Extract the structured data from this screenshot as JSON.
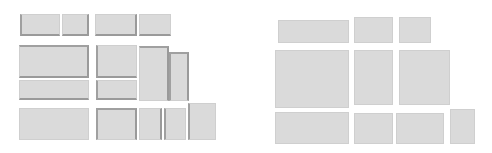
{
  "diagram": {
    "colors": {
      "tile_fill": "#dadada",
      "tile_edge": "#9a9a9a",
      "background": "#ffffff"
    },
    "panels": [
      {
        "name": "left",
        "tiles": [
          {
            "x": 20,
            "y": 14,
            "w": 40,
            "h": 22,
            "edges": "l b"
          },
          {
            "x": 62,
            "y": 14,
            "w": 27,
            "h": 22,
            "edges": "b r"
          },
          {
            "x": 95,
            "y": 14,
            "w": 42,
            "h": 22,
            "edges": "b r"
          },
          {
            "x": 139,
            "y": 14,
            "w": 32,
            "h": 22,
            "edges": "b"
          },
          {
            "x": 19,
            "y": 45,
            "w": 70,
            "h": 33,
            "edges": "t r b"
          },
          {
            "x": 96,
            "y": 45,
            "w": 41,
            "h": 33,
            "edges": "l b"
          },
          {
            "x": 139,
            "y": 46,
            "w": 30,
            "h": 55,
            "edges": "t r"
          },
          {
            "x": 169,
            "y": 52,
            "w": 20,
            "h": 49,
            "edges": "t r l"
          },
          {
            "x": 19,
            "y": 80,
            "w": 70,
            "h": 20,
            "edges": "b"
          },
          {
            "x": 96,
            "y": 80,
            "w": 41,
            "h": 20,
            "edges": "l b"
          },
          {
            "x": 19,
            "y": 108,
            "w": 70,
            "h": 32,
            "edges": ""
          },
          {
            "x": 96,
            "y": 108,
            "w": 41,
            "h": 32,
            "edges": "l t r"
          },
          {
            "x": 139,
            "y": 108,
            "w": 23,
            "h": 32,
            "edges": "r"
          },
          {
            "x": 164,
            "y": 108,
            "w": 22,
            "h": 32,
            "edges": "l"
          },
          {
            "x": 188,
            "y": 103,
            "w": 28,
            "h": 37,
            "edges": "l"
          }
        ]
      },
      {
        "name": "right",
        "tiles": [
          {
            "x": 278,
            "y": 20,
            "w": 71,
            "h": 23,
            "edges": ""
          },
          {
            "x": 354,
            "y": 17,
            "w": 39,
            "h": 26,
            "edges": ""
          },
          {
            "x": 399,
            "y": 17,
            "w": 32,
            "h": 26,
            "edges": ""
          },
          {
            "x": 275,
            "y": 50,
            "w": 74,
            "h": 58,
            "edges": ""
          },
          {
            "x": 354,
            "y": 50,
            "w": 39,
            "h": 55,
            "edges": ""
          },
          {
            "x": 399,
            "y": 50,
            "w": 51,
            "h": 55,
            "edges": ""
          },
          {
            "x": 275,
            "y": 112,
            "w": 74,
            "h": 32,
            "edges": ""
          },
          {
            "x": 354,
            "y": 113,
            "w": 39,
            "h": 31,
            "edges": ""
          },
          {
            "x": 396,
            "y": 113,
            "w": 48,
            "h": 31,
            "edges": ""
          },
          {
            "x": 450,
            "y": 109,
            "w": 25,
            "h": 35,
            "edges": ""
          }
        ]
      }
    ]
  }
}
